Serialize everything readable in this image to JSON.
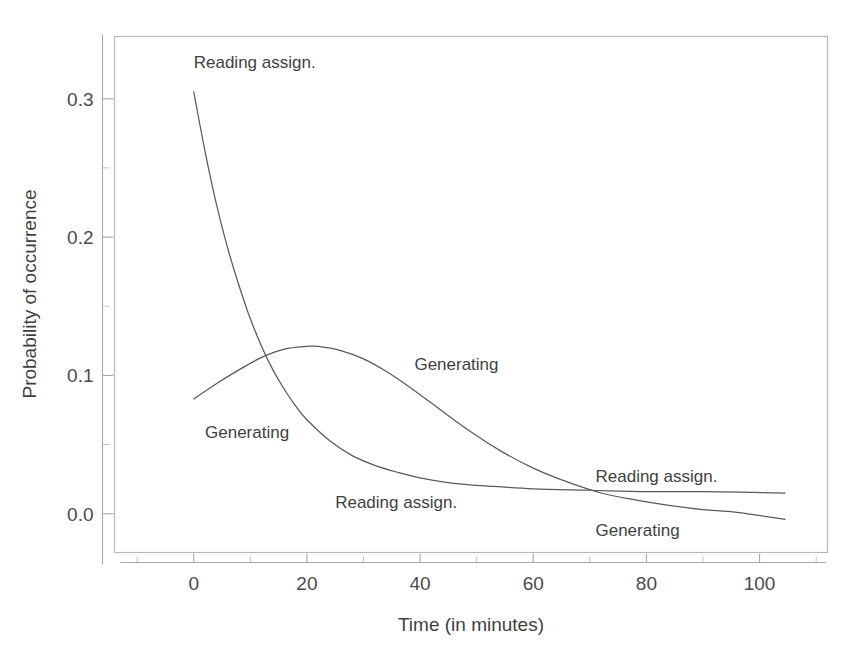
{
  "chart_data": {
    "type": "line",
    "title": "",
    "subtitle": "",
    "xlabel": "Time (in minutes)",
    "ylabel": "Probability of occurrence",
    "xlim": [
      -14,
      112
    ],
    "ylim": [
      -0.028,
      0.345
    ],
    "grid": false,
    "legend_position": "inline-annotations",
    "xticks": [
      {
        "value": 0,
        "label": "0"
      },
      {
        "value": 20,
        "label": "20"
      },
      {
        "value": 40,
        "label": "40"
      },
      {
        "value": 60,
        "label": "60"
      },
      {
        "value": 80,
        "label": "80"
      },
      {
        "value": 100,
        "label": "100"
      }
    ],
    "xminor_ticks": [
      -10,
      10,
      30,
      50,
      70,
      90,
      110
    ],
    "yticks": [
      {
        "value": 0.0,
        "label": "0.0"
      },
      {
        "value": 0.1,
        "label": "0.1"
      },
      {
        "value": 0.2,
        "label": "0.2"
      },
      {
        "value": 0.3,
        "label": "0.3"
      }
    ],
    "yminor_ticks": [
      0.05,
      0.15,
      0.25
    ],
    "series": [
      {
        "name": "Reading assign.",
        "color": "#5a5a5a",
        "x": [
          0,
          2,
          4,
          6,
          8,
          10,
          12,
          14,
          16,
          18,
          20,
          24,
          28,
          32,
          36,
          40,
          46,
          52,
          60,
          70,
          80,
          90,
          104.5
        ],
        "values": [
          0.305,
          0.262,
          0.224,
          0.192,
          0.165,
          0.141,
          0.121,
          0.104,
          0.09,
          0.078,
          0.068,
          0.053,
          0.042,
          0.035,
          0.03,
          0.026,
          0.022,
          0.02,
          0.018,
          0.017,
          0.016,
          0.016,
          0.015
        ]
      },
      {
        "name": "Generating",
        "color": "#5a5a5a",
        "x": [
          0,
          4,
          8,
          12,
          16,
          20,
          22,
          26,
          30,
          34,
          38,
          42,
          48,
          54,
          60,
          66,
          72,
          78,
          84,
          90,
          96,
          104.5
        ],
        "values": [
          0.083,
          0.094,
          0.104,
          0.113,
          0.119,
          0.121,
          0.121,
          0.118,
          0.112,
          0.103,
          0.092,
          0.08,
          0.062,
          0.046,
          0.033,
          0.023,
          0.015,
          0.01,
          0.006,
          0.003,
          0.001,
          -0.004
        ]
      }
    ],
    "annotations": [
      {
        "text": "Reading assign.",
        "x": 0,
        "y": 0.322,
        "anchor": "start",
        "data_name": "curve-label-reading-top"
      },
      {
        "text": "Generating",
        "x": 2,
        "y": 0.055,
        "anchor": "start",
        "data_name": "curve-label-generating-left"
      },
      {
        "text": "Generating",
        "x": 39,
        "y": 0.104,
        "anchor": "start",
        "data_name": "curve-label-generating-peak"
      },
      {
        "text": "Reading assign.",
        "x": 25,
        "y": 0.004,
        "anchor": "start",
        "data_name": "curve-label-reading-bottom"
      },
      {
        "text": "Reading assign.",
        "x": 71,
        "y": 0.023,
        "anchor": "start",
        "data_name": "curve-label-reading-right"
      },
      {
        "text": "Generating",
        "x": 71,
        "y": -0.016,
        "anchor": "start",
        "data_name": "curve-label-generating-right"
      }
    ]
  },
  "figure": {
    "background_color": "#ffffff",
    "frame_color": "#b9b9b9",
    "curve_color": "#5a5a5a",
    "text_color": "#3f3f3f"
  }
}
